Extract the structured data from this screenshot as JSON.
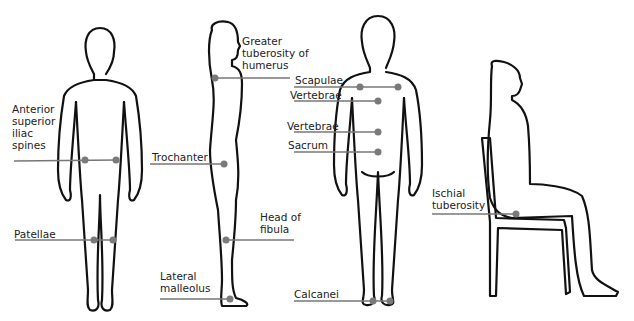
{
  "figures": [
    {
      "id": "front-standing",
      "view": "anterior standing"
    },
    {
      "id": "side-standing",
      "view": "lateral standing"
    },
    {
      "id": "back-standing",
      "view": "posterior standing"
    },
    {
      "id": "side-seated",
      "view": "lateral seated on chair"
    }
  ],
  "labels": {
    "asis": "Anterior\nsuperior\niliac\nspines",
    "patellae": "Patellae",
    "greater_tuberosity": "Greater\ntuberosity of\nhumerus",
    "trochanter": "Trochanter",
    "head_fibula": "Head of\nfibula",
    "lateral_malleolus": "Lateral\nmalleolus",
    "scapulae": "Scapulae",
    "vertebrae_upper": "Vertebrae",
    "vertebrae_lower": "Vertebrae",
    "sacrum": "Sacrum",
    "calcanei": "Calcanei",
    "ischial_tuberosity": "Ischial\ntuberosity"
  },
  "colors": {
    "outline": "#111111",
    "marker": "#7a7a7a",
    "leader": "#777777"
  }
}
